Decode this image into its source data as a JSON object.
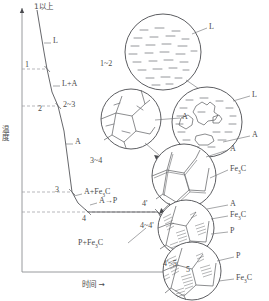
{
  "figure": {
    "type": "diagram",
    "axes": {
      "y_label": "温度",
      "y_arrow": "→",
      "x_label": "时间",
      "x_arrow": "→"
    },
    "curve_points": [
      {
        "id": "1",
        "label": "1"
      },
      {
        "id": "2",
        "label": "2"
      },
      {
        "id": "3",
        "label": "3"
      },
      {
        "id": "4",
        "label": "4"
      },
      {
        "id": "4p",
        "label": "4'"
      },
      {
        "id": "5",
        "label": "5"
      }
    ],
    "phase_labels": [
      {
        "id": "above1",
        "text": "1以上"
      },
      {
        "id": "L",
        "text": "L"
      },
      {
        "id": "LA",
        "text": "L+A"
      },
      {
        "id": "A",
        "text": "A"
      },
      {
        "id": "AFe3C",
        "text": "A+Fe",
        "sub": "3",
        "text2": "C"
      },
      {
        "id": "AtoP",
        "text": "A→P"
      },
      {
        "id": "PFe3C",
        "text": "P+Fe",
        "sub": "3",
        "text2": "C"
      }
    ],
    "insets": [
      {
        "id": "inset-1",
        "stage": "1以上",
        "callouts": [
          "L"
        ]
      },
      {
        "id": "inset-1-2",
        "stage": "1~2",
        "callouts": [
          "L",
          "A"
        ]
      },
      {
        "id": "inset-2-3",
        "stage": "2~3",
        "callouts": [
          "A"
        ]
      },
      {
        "id": "inset-3-4",
        "stage": "3~4",
        "callouts": [
          "A",
          "Fe3C"
        ]
      },
      {
        "id": "inset-4-4p",
        "stage": "4~4'",
        "callouts": [
          "A",
          "Fe3C",
          "P"
        ]
      },
      {
        "id": "inset-4p-5",
        "stage": "4'~5",
        "callouts": [
          "P",
          "Fe3C"
        ]
      }
    ],
    "inset_stage_labels": {
      "s1": "1以上",
      "s12": "1~2",
      "s23": "2~3",
      "s34": "3~4",
      "s44p": "4~4'",
      "s4p5": "4'~5"
    },
    "callout_text": {
      "L": "L",
      "A": "A",
      "P": "P",
      "Fe3C_a": "Fe",
      "Fe3C_sub": "3",
      "Fe3C_b": "C"
    },
    "colors": {
      "line": "#55565a",
      "axis": "#8d8e92",
      "dash": "#9a9a9e",
      "text": "#4a4a4a",
      "background": "#ffffff"
    }
  }
}
